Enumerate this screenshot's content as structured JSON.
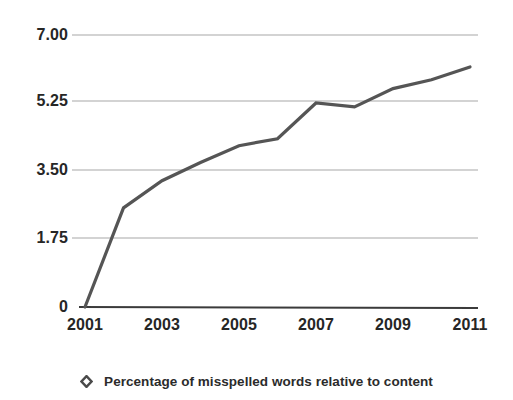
{
  "chart_data": {
    "type": "line",
    "title": "",
    "xlabel": "",
    "ylabel": "",
    "x": [
      2001,
      2002,
      2003,
      2004,
      2005,
      2006,
      2007,
      2008,
      2009,
      2010,
      2011
    ],
    "xtick_labels": [
      "2001",
      "2003",
      "2005",
      "2007",
      "2009",
      "2011"
    ],
    "xtick_values": [
      2001,
      2003,
      2005,
      2007,
      2009,
      2011
    ],
    "xlim": [
      2001,
      2011
    ],
    "ytick_labels": [
      "7.00",
      "5.25",
      "3.50",
      "1.75",
      "0"
    ],
    "ytick_values": [
      7.0,
      5.25,
      3.5,
      1.75,
      0
    ],
    "ylim": [
      0,
      7.25
    ],
    "grid": true,
    "grid_axis": "y",
    "legend_position": "bottom",
    "series": [
      {
        "name": "Percentage of misspelled words relative to content",
        "marker": "diamond-open",
        "values": [
          0,
          2.55,
          3.25,
          3.72,
          4.15,
          4.33,
          5.25,
          5.15,
          5.62,
          5.85,
          6.18
        ]
      }
    ],
    "colors": {
      "line": "#555555",
      "grid": "#c4c4c4",
      "axis": "#3b3b3b",
      "text": "#262626",
      "background": "#ffffff"
    }
  },
  "legend": {
    "items": [
      {
        "label": "Percentage of misspelled words relative to content",
        "marker": "diamond-open-icon"
      }
    ]
  }
}
